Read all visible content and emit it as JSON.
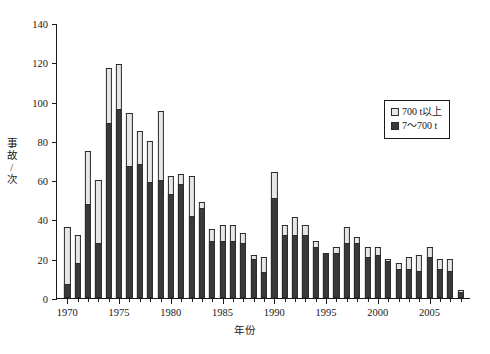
{
  "chart_data": {
    "type": "bar",
    "stacked": true,
    "title": "",
    "xlabel": "年份",
    "ylabel": "事故/次",
    "ylim": [
      0,
      140
    ],
    "ytick_values": [
      0,
      20,
      40,
      60,
      80,
      100,
      120,
      140
    ],
    "ytick_labels": [
      "0",
      "20",
      "40",
      "60",
      "80",
      "100",
      "120",
      "140"
    ],
    "xlim": [
      1969,
      2009
    ],
    "xtick_major_labels": [
      "1970",
      "1975",
      "1980",
      "1985",
      "1990",
      "1995",
      "2000",
      "2005"
    ],
    "xtick_major_values": [
      1970,
      1975,
      1980,
      1985,
      1990,
      1995,
      2000,
      2005
    ],
    "grid": false,
    "legend_position": "upper right",
    "categories": [
      1970,
      1971,
      1972,
      1973,
      1974,
      1975,
      1976,
      1977,
      1978,
      1979,
      1980,
      1981,
      1982,
      1983,
      1984,
      1985,
      1986,
      1987,
      1988,
      1989,
      1990,
      1991,
      1992,
      1993,
      1994,
      1995,
      1996,
      1997,
      1998,
      1999,
      2000,
      2001,
      2002,
      2003,
      2004,
      2005,
      2006,
      2007,
      2008
    ],
    "series": [
      {
        "name": "7～700 t",
        "color": "#3a3a3a",
        "values": [
          7,
          18,
          48,
          28,
          89,
          96,
          67,
          68,
          59,
          60,
          53,
          58,
          42,
          46,
          29,
          29,
          29,
          28,
          20,
          13,
          51,
          32,
          32,
          32,
          26,
          23,
          23,
          28,
          28,
          21,
          22,
          19,
          15,
          15,
          14,
          21,
          15,
          14,
          3
        ]
      },
      {
        "name": "700 t以上",
        "color": "#e6e6e6",
        "values": [
          29,
          14,
          27,
          32,
          28,
          23,
          27,
          17,
          21,
          35,
          9,
          5,
          20,
          3,
          6,
          8,
          8,
          5,
          2,
          8,
          13,
          5,
          9,
          5,
          3,
          0,
          3,
          8,
          3,
          5,
          4,
          1,
          3,
          6,
          8,
          5,
          5,
          6,
          1
        ]
      }
    ],
    "totals": [
      36,
      32,
      75,
      60,
      117,
      119,
      94,
      85,
      80,
      95,
      62,
      63,
      62,
      49,
      35,
      37,
      37,
      33,
      22,
      21,
      64,
      37,
      41,
      37,
      29,
      23,
      26,
      36,
      31,
      26,
      26,
      20,
      18,
      21,
      22,
      26,
      20,
      20,
      4
    ]
  },
  "legend": {
    "entries": [
      {
        "label": "700 t以上"
      },
      {
        "label": "7～700 t"
      }
    ]
  },
  "axes": {
    "y_title": "事故/次",
    "x_title": "年份"
  }
}
